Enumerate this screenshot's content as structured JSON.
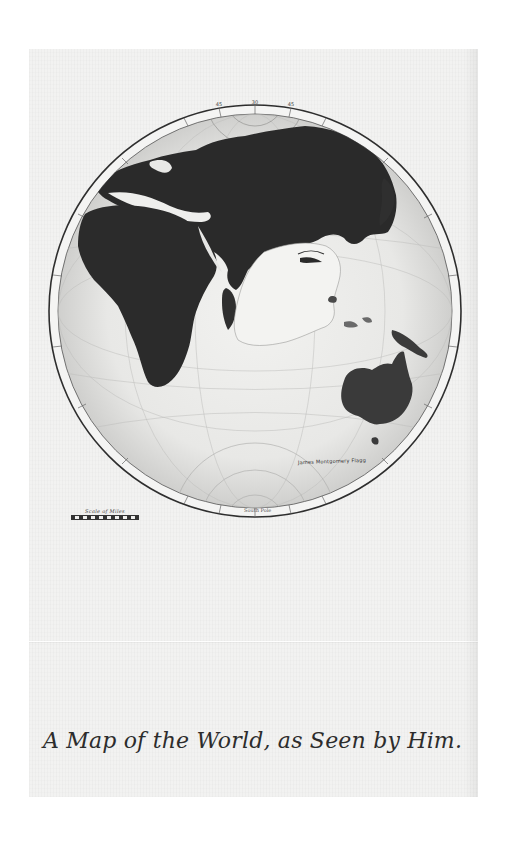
{
  "map": {
    "title": "A Map of the World, as Seen by Him.",
    "signature": "James Montgomery Flagg",
    "scale_label": "Scale of Miles",
    "pole_label": "South Pole",
    "rim_labels_top": [
      "45",
      "30",
      "45"
    ],
    "regions": [
      "Europe",
      "Asia",
      "Africa",
      "Arabia",
      "India",
      "Indonesia",
      "Australia",
      "Japan",
      "Antarctica"
    ],
    "colors": {
      "paper": "#f2f2f1",
      "ocean": "#e4e4e2",
      "land": "#2a2a2a",
      "rim": "#3a3a3a",
      "ink": "#2c2c2c"
    }
  }
}
